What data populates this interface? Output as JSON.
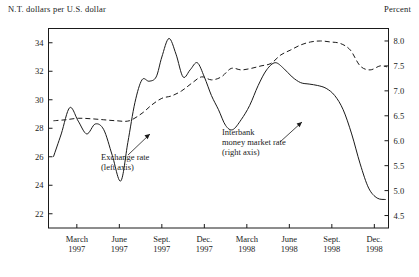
{
  "figure": {
    "left_unit_label": "N.T. dollars per U.S. dollar",
    "right_unit_label": "Percent"
  },
  "annotations": {
    "exchange_rate": {
      "line1": "Exchange rate",
      "line2": "(left axis)"
    },
    "interbank": {
      "line1": "Interbank",
      "line2": "money market rate",
      "line3": "(right axis)"
    }
  },
  "chart_data": {
    "type": "line",
    "title": "",
    "xlabel": "",
    "ylabel": "N.T. dollars per U.S. dollar",
    "y2label": "Percent",
    "grid": false,
    "legend_position": "inline-annotations",
    "xlim": [
      0,
      24
    ],
    "ylim": [
      21,
      35
    ],
    "y2lim": [
      4.25,
      8.25
    ],
    "yticks": [
      22,
      24,
      26,
      28,
      30,
      32,
      34
    ],
    "ytick_labels": [
      "22",
      "24",
      "26",
      "28",
      "30",
      "32",
      "34"
    ],
    "y2ticks": [
      4.5,
      5.0,
      5.5,
      6.0,
      6.5,
      7.0,
      7.5,
      8.0
    ],
    "y2tick_labels": [
      "4.5",
      "5.0",
      "5.5",
      "6.0",
      "6.5",
      "7.0",
      "7.5",
      "8.0"
    ],
    "xticks": [
      2,
      5,
      8,
      11,
      14,
      17,
      20,
      23
    ],
    "xtick_labels": [
      {
        "month": "March",
        "year": "1997"
      },
      {
        "month": "June",
        "year": "1997"
      },
      {
        "month": "Sept.",
        "year": "1997"
      },
      {
        "month": "Dec.",
        "year": "1997"
      },
      {
        "month": "March",
        "year": "1998"
      },
      {
        "month": "June",
        "year": "1998"
      },
      {
        "month": "Sept.",
        "year": "1998"
      },
      {
        "month": "Dec.",
        "year": "1998"
      }
    ],
    "series": [
      {
        "name": "Exchange rate",
        "axis": "left",
        "style": "solid",
        "x": [
          0.35,
          0.9,
          1.5,
          2.1,
          2.7,
          3.3,
          3.9,
          4.5,
          5.1,
          5.6,
          6.1,
          6.6,
          7.1,
          7.6,
          8.0,
          8.5,
          9.0,
          9.5,
          10.0,
          10.5,
          11.0,
          11.5,
          12.0,
          12.5,
          13.0,
          13.6,
          14.2,
          14.8,
          15.4,
          16.0,
          16.6,
          17.2,
          17.8,
          18.4,
          19.0,
          19.6,
          20.2,
          20.8,
          21.4,
          22.0,
          22.6,
          23.2,
          23.8
        ],
        "values": [
          26.0,
          27.6,
          29.45,
          28.5,
          27.6,
          28.3,
          27.9,
          26.1,
          24.3,
          27.0,
          29.8,
          31.4,
          31.3,
          31.6,
          33.0,
          34.3,
          33.2,
          31.6,
          32.1,
          32.6,
          31.6,
          30.3,
          29.3,
          28.2,
          27.9,
          28.6,
          29.6,
          31.0,
          32.1,
          32.6,
          32.2,
          31.6,
          31.2,
          31.1,
          31.0,
          30.8,
          30.3,
          29.3,
          27.6,
          25.5,
          23.8,
          23.1,
          23.0
        ]
      },
      {
        "name": "Interbank money market rate",
        "axis": "right",
        "style": "dashed",
        "x": [
          0.35,
          1.2,
          2.1,
          3.0,
          3.9,
          4.8,
          5.7,
          6.6,
          7.3,
          8.0,
          8.7,
          9.4,
          10.1,
          10.8,
          11.5,
          12.2,
          12.9,
          13.6,
          14.3,
          15.0,
          15.7,
          16.4,
          17.1,
          17.8,
          18.5,
          19.2,
          19.9,
          20.6,
          21.3,
          22.0,
          22.7,
          23.4,
          23.9
        ],
        "values": [
          6.4,
          6.42,
          6.45,
          6.44,
          6.42,
          6.4,
          6.4,
          6.55,
          6.72,
          6.85,
          6.9,
          7.0,
          7.15,
          7.28,
          7.22,
          7.28,
          7.45,
          7.42,
          7.45,
          7.5,
          7.55,
          7.72,
          7.82,
          7.92,
          7.98,
          8.0,
          7.98,
          7.95,
          7.82,
          7.5,
          7.42,
          7.5,
          7.48
        ]
      }
    ]
  }
}
